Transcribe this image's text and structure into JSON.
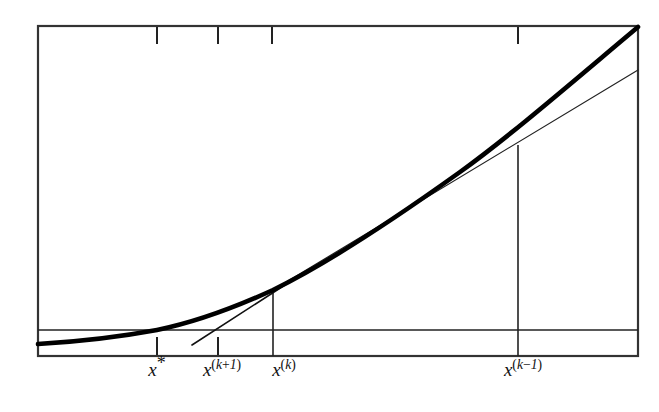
{
  "figure": {
    "colors": {
      "ink": "#111111",
      "background": "#ffffff",
      "curve": "#000000",
      "line": "#222222",
      "frame": "#333333"
    },
    "frame": {
      "left": 38,
      "top": 26,
      "right": 638,
      "bottom": 356
    },
    "horizontal_reference_line": {
      "name": "zero-level-line",
      "y": 330
    },
    "ticks": {
      "top_border": [
        157,
        218,
        272,
        518
      ],
      "bottom_border": [
        157,
        218
      ]
    },
    "labels": [
      {
        "id": "x-star",
        "text": "x*",
        "base": "x",
        "sup": "*",
        "x": 157,
        "y": 368
      },
      {
        "id": "x-kp1",
        "text": "x^(k+1)",
        "base": "x",
        "sup": "(k+1)",
        "x": 222,
        "y": 368
      },
      {
        "id": "x-k",
        "text": "x^(k)",
        "base": "x",
        "sup": "(k)",
        "x": 284,
        "y": 368
      },
      {
        "id": "x-km1",
        "text": "x^(k-1)",
        "base": "x",
        "sup": "(k-1)",
        "x": 523,
        "y": 368
      }
    ],
    "vertical_drop_lines": [
      {
        "id": "drop-at-xk",
        "x": 273,
        "y_top": 290,
        "y_bottom": 356
      },
      {
        "id": "drop-at-xkm1",
        "x": 518,
        "y_top": 145,
        "y_bottom": 356
      }
    ],
    "curve": {
      "name": "objective-function-curve",
      "stroke_width": 4.6,
      "path": "M 38 344 C 90 341, 130 335, 157 330 C 196 322, 238 306, 273 290 C 330 262, 400 215, 460 172 C 510 136, 570 84, 638 27"
    },
    "secant_line": {
      "name": "secant-line-through-xk-and-xkm1",
      "x1": 273,
      "y1": 290,
      "x2": 638,
      "y2": 70,
      "stroke_width": 1.2
    },
    "tangent_line": {
      "name": "tangent-chord-at-xk",
      "x1": 192,
      "y1": 345,
      "x2": 288,
      "y2": 283,
      "stroke_width": 1.6
    }
  },
  "chart_data": {
    "type": "line",
    "title": "",
    "xlabel": "",
    "ylabel": "",
    "grid": false,
    "legend": "none",
    "xlim": [
      0,
      1
    ],
    "ylim": [
      0,
      1
    ],
    "annotations": [
      "x*",
      "x^(k+1)",
      "x^(k)",
      "x^(k-1)"
    ],
    "series": [
      {
        "name": "f(x)",
        "role": "convex-increasing-function",
        "x": [
          0.0,
          0.1,
          0.2,
          0.27,
          0.39,
          0.5,
          0.62,
          0.74,
          0.85,
          1.0
        ],
        "y": [
          0.036,
          0.062,
          0.096,
          0.121,
          0.182,
          0.247,
          0.33,
          0.421,
          0.52,
          0.69
        ]
      },
      {
        "name": "secant",
        "role": "secant-through-xk-xkm1",
        "x": [
          0.392,
          1.0
        ],
        "y": [
          0.121,
          0.545
        ]
      },
      {
        "name": "tangent",
        "role": "tangent-chord-at-xk",
        "x": [
          0.257,
          0.417
        ],
        "y": [
          0.033,
          0.154
        ]
      },
      {
        "name": "zero-level",
        "role": "horizontal-reference",
        "x": [
          0.0,
          1.0
        ],
        "y": [
          0.079,
          0.079
        ]
      }
    ],
    "marked_points": [
      {
        "label": "x*",
        "x": 0.198,
        "note": "root of f, where curve crosses the horizontal line"
      },
      {
        "label": "x^(k+1)",
        "x": 0.3,
        "note": "next iterate, where the tangent/secant meets the horizontal line"
      },
      {
        "label": "x^(k)",
        "x": 0.392,
        "note": "current iterate"
      },
      {
        "label": "x^(k-1)",
        "x": 0.8,
        "note": "previous iterate"
      }
    ]
  }
}
